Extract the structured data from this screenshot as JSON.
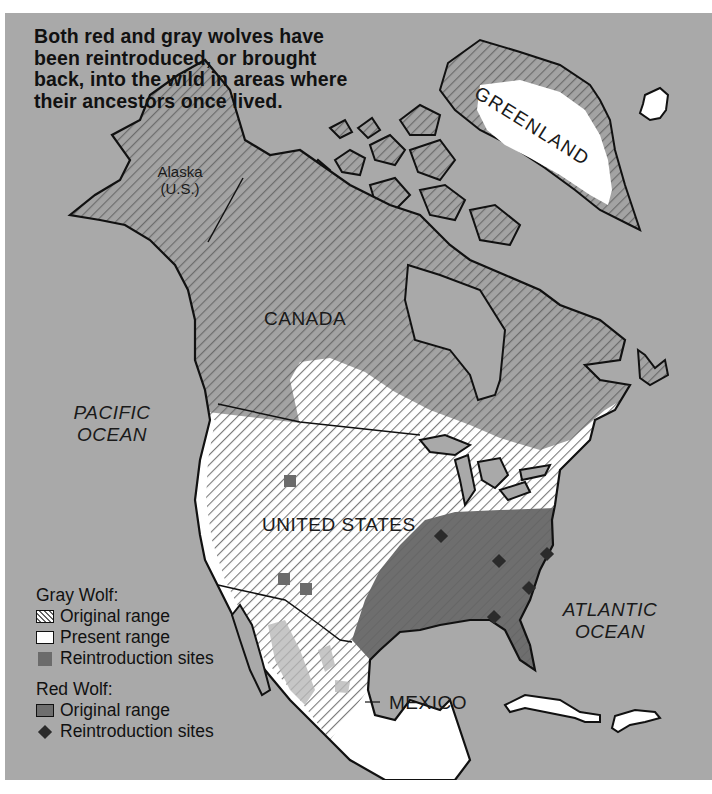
{
  "headline": "Both red and gray wolves have been reintroduced, or brought back, into the wild in areas where their ancestors once lived.",
  "labels": {
    "greenland": "GREENLAND",
    "alaska_line1": "Alaska",
    "alaska_line2": "(U.S.)",
    "canada": "CANADA",
    "united_states": "UNITED STATES",
    "mexico": "MEXICO",
    "pacific_line1": "PACIFIC",
    "pacific_line2": "OCEAN",
    "atlantic_line1": "ATLANTIC",
    "atlantic_line2": "OCEAN"
  },
  "legend": {
    "gray_wolf": {
      "title": "Gray Wolf:",
      "items": [
        {
          "symbol": "hatched-square",
          "label": "Original range"
        },
        {
          "symbol": "white-square",
          "label": "Present range"
        },
        {
          "symbol": "dark-gray-square",
          "label": "Reintroduction sites"
        }
      ]
    },
    "red_wolf": {
      "title": "Red Wolf:",
      "items": [
        {
          "symbol": "dark-gray-filled-square",
          "label": "Original range"
        },
        {
          "symbol": "diamond",
          "label": "Reintroduction sites"
        }
      ]
    }
  },
  "colors": {
    "ocean": "#a9a9a9",
    "present_range": "#ffffff",
    "hatch_line": "#6f6f6f",
    "red_wolf_range": "#6e6e6e",
    "gray_site": "#6b6b6b",
    "red_site": "#2b2b2b",
    "outline": "#111111"
  },
  "markers": {
    "gray_wolf_reintroduction_sites": [
      {
        "x": 290,
        "y": 481
      },
      {
        "x": 284,
        "y": 579
      },
      {
        "x": 306,
        "y": 589
      }
    ],
    "red_wolf_reintroduction_sites": [
      {
        "x": 441,
        "y": 536
      },
      {
        "x": 499,
        "y": 561
      },
      {
        "x": 547,
        "y": 554
      },
      {
        "x": 529,
        "y": 588
      },
      {
        "x": 494,
        "y": 617
      }
    ]
  }
}
